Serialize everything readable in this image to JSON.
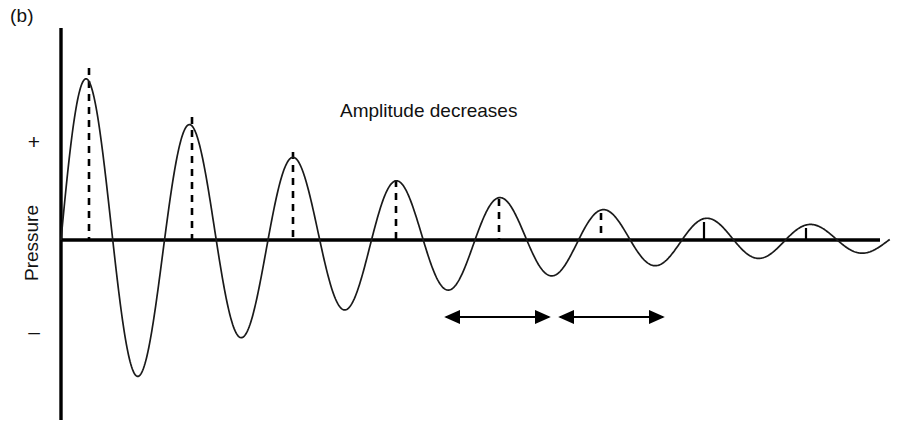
{
  "figure": {
    "panel_label": "(b)",
    "annotation": "Amplitude decreases",
    "axis_title": "Pressure",
    "sign_positive": "+",
    "sign_negative": "–",
    "line_color": "#1a1a1a",
    "axis_color": "#000000",
    "background": "#ffffff"
  },
  "chart_data": {
    "type": "line",
    "title": "",
    "subtitle": "",
    "xlabel": "",
    "ylabel": "Pressure",
    "grid": false,
    "legend_position": "none",
    "annotations": [
      {
        "text": "Amplitude decreases",
        "x": 470,
        "y": 112
      },
      {
        "text": "(b)",
        "x": 18,
        "y": 18
      },
      {
        "text": "+",
        "x": 34,
        "y": 143
      },
      {
        "text": "–",
        "x": 34,
        "y": 335
      }
    ],
    "axis": {
      "vertical_x": 61,
      "vertical_y_top": 28,
      "vertical_y_bottom": 420,
      "baseline_y": 240,
      "baseline_x_start": 61,
      "baseline_x_end": 880
    },
    "waveform": {
      "model": "A0 * exp(-t/tau) * sin(2*pi*t/T)",
      "x_start": 61,
      "x_end": 890,
      "period_px": 103.5,
      "phase_offset_px": 61,
      "initial_amplitude_px": 175,
      "decay_constant_px": 310
    },
    "peaks": [
      {
        "index": 1,
        "x": 89,
        "y": 66,
        "amplitude": 174
      },
      {
        "index": 2,
        "x": 192,
        "y": 115,
        "amplitude": 125
      },
      {
        "index": 3,
        "x": 293,
        "y": 150,
        "amplitude": 90
      },
      {
        "index": 4,
        "x": 396,
        "y": 178,
        "amplitude": 62
      },
      {
        "index": 5,
        "x": 499,
        "y": 197,
        "amplitude": 43
      },
      {
        "index": 6,
        "x": 601,
        "y": 211,
        "amplitude": 29
      },
      {
        "index": 7,
        "x": 704,
        "y": 220,
        "amplitude": 20
      },
      {
        "index": 8,
        "x": 806,
        "y": 226,
        "amplitude": 14
      }
    ],
    "troughs": [
      {
        "index": 1,
        "x": 140,
        "y": 404,
        "amplitude": -164
      },
      {
        "index": 2,
        "x": 243,
        "y": 347,
        "amplitude": -107
      },
      {
        "index": 3,
        "x": 345,
        "y": 317,
        "amplitude": -77
      },
      {
        "index": 4,
        "x": 448,
        "y": 292,
        "amplitude": -52
      },
      {
        "index": 5,
        "x": 550,
        "y": 276,
        "amplitude": -36
      },
      {
        "index": 6,
        "x": 653,
        "y": 265,
        "amplitude": -25
      },
      {
        "index": 7,
        "x": 755,
        "y": 257,
        "amplitude": -17
      },
      {
        "index": 8,
        "x": 858,
        "y": 252,
        "amplitude": -12
      }
    ],
    "period_arrows": [
      {
        "index": 1,
        "x_start": 446,
        "x_end": 549,
        "y": 317,
        "length_px": 103
      },
      {
        "index": 2,
        "x_start": 560,
        "x_end": 663,
        "y": 317,
        "length_px": 103
      }
    ]
  }
}
